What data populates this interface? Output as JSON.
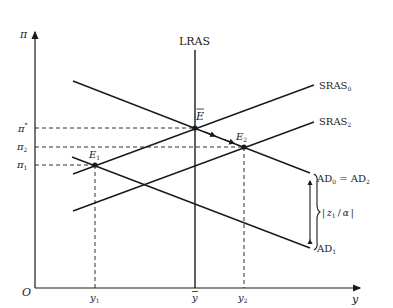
{
  "diagram": {
    "axes": {
      "y_label": "π",
      "x_label": "y",
      "origin_label": "O"
    },
    "y_ticks": [
      {
        "label": "π*",
        "sym": "π",
        "sup": "*"
      },
      {
        "label": "π2",
        "sym": "π",
        "sub": "2"
      },
      {
        "label": "π1",
        "sym": "π",
        "sub": "1"
      }
    ],
    "x_ticks": [
      {
        "label": "y1",
        "sym": "y",
        "sub": "1"
      },
      {
        "label": "ȳ",
        "sym": "y",
        "bar": true
      },
      {
        "label": "y2",
        "sym": "y",
        "sub": "2"
      }
    ],
    "curves": {
      "lras": "LRAS",
      "sras0": {
        "base": "SRAS",
        "sub": "0"
      },
      "sras2": {
        "base": "SRAS",
        "sub": "2"
      },
      "ad0_ad2": {
        "base1": "AD",
        "sub1": "0",
        "eq": " = ",
        "base2": "AD",
        "sub2": "2"
      },
      "ad1": {
        "base": "AD",
        "sub": "1"
      }
    },
    "points": {
      "e_bar": "E",
      "e1": {
        "base": "E",
        "sub": "1"
      },
      "e2": {
        "base": "E",
        "sub": "2"
      }
    },
    "shift_annotation": "|z1/α|",
    "shift_parts": {
      "open": "|",
      "sym": "z",
      "sub": "1",
      "slash": "/",
      "alpha": "α",
      "close": "|"
    },
    "colors": {
      "ink": "#1a1a1a",
      "background": "#ffffff"
    }
  }
}
